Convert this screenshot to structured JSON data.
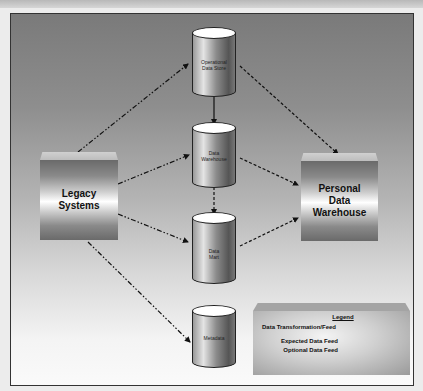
{
  "diagram": {
    "nodes": {
      "legacy": {
        "label_line1": "Legacy",
        "label_line2": "Systems"
      },
      "ods": {
        "label_line1": "Operational",
        "label_line2": "Data Store"
      },
      "dw": {
        "label_line1": "Data",
        "label_line2": "Warehouse"
      },
      "dm": {
        "label_line1": "Data",
        "label_line2": "Mart"
      },
      "meta": {
        "label_line1": "Metadata"
      },
      "pdw": {
        "label_line1": "Personal",
        "label_line2": "Data",
        "label_line3": "Warehouse"
      }
    },
    "edges": [
      {
        "from": "Legacy Systems",
        "to": "Operational Data Store",
        "type": "Data Transformation/Feed"
      },
      {
        "from": "Legacy Systems",
        "to": "Data Warehouse",
        "type": "Data Transformation/Feed"
      },
      {
        "from": "Legacy Systems",
        "to": "Data Mart",
        "type": "Data Transformation/Feed"
      },
      {
        "from": "Legacy Systems",
        "to": "Metadata",
        "type": "Data Transformation/Feed"
      },
      {
        "from": "Operational Data Store",
        "to": "Data Warehouse",
        "type": "Expected Data Feed"
      },
      {
        "from": "Data Warehouse",
        "to": "Data Mart",
        "type": "Optional Data Feed"
      },
      {
        "from": "Operational Data Store",
        "to": "Personal Data Warehouse",
        "type": "Optional Data Feed"
      },
      {
        "from": "Data Warehouse",
        "to": "Personal Data Warehouse",
        "type": "Optional Data Feed"
      },
      {
        "from": "Data Mart",
        "to": "Personal Data Warehouse",
        "type": "Optional Data Feed"
      }
    ],
    "legend": {
      "title": "Legend",
      "items": [
        {
          "label": "Data Transformation/Feed",
          "style": "dash-dot"
        },
        {
          "label": "Expected Data Feed",
          "style": "solid"
        },
        {
          "label": "Optional Data Feed",
          "style": "dashed"
        }
      ]
    }
  }
}
